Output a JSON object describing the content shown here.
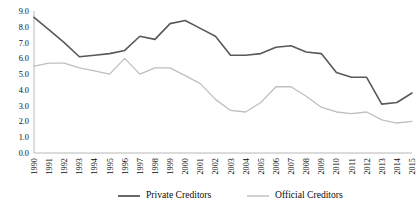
{
  "chart_data": {
    "type": "line",
    "title": "",
    "xlabel": "",
    "ylabel": "",
    "grid": false,
    "legend_position": "bottom",
    "ylim": [
      0.0,
      9.0
    ],
    "ytick_step": 1.0,
    "yticks": [
      "9.0",
      "8.0",
      "7.0",
      "6.0",
      "5.0",
      "4.0",
      "3.0",
      "2.0",
      "1.0",
      "0.0"
    ],
    "categories": [
      "1990",
      "1991",
      "1992",
      "1993",
      "1994",
      "1995",
      "1996",
      "1997",
      "1998",
      "1999",
      "2000",
      "2001",
      "2002",
      "2003",
      "2004",
      "2005",
      "2006",
      "2007",
      "2008",
      "2009",
      "2010",
      "2011",
      "2012",
      "2013",
      "2014",
      "2015"
    ],
    "series": [
      {
        "name": "Private Creditors",
        "color": "#595959",
        "values": [
          8.6,
          7.8,
          7.0,
          6.1,
          6.2,
          6.3,
          6.5,
          7.4,
          7.2,
          8.2,
          8.4,
          7.9,
          7.4,
          6.2,
          6.2,
          6.3,
          6.7,
          6.8,
          6.4,
          6.3,
          5.1,
          4.8,
          4.8,
          3.1,
          3.2,
          3.8
        ]
      },
      {
        "name": "Official Creditors",
        "color": "#bfbfbf",
        "values": [
          5.5,
          5.7,
          5.7,
          5.4,
          5.2,
          5.0,
          6.0,
          5.0,
          5.4,
          5.4,
          4.9,
          4.4,
          3.4,
          2.7,
          2.6,
          3.2,
          4.2,
          4.2,
          3.6,
          2.9,
          2.6,
          2.5,
          2.6,
          2.1,
          1.9,
          2.0
        ]
      }
    ]
  },
  "legend": {
    "items": [
      {
        "label": "Private Creditors",
        "color": "#595959"
      },
      {
        "label": "Official Creditors",
        "color": "#bfbfbf"
      }
    ]
  }
}
